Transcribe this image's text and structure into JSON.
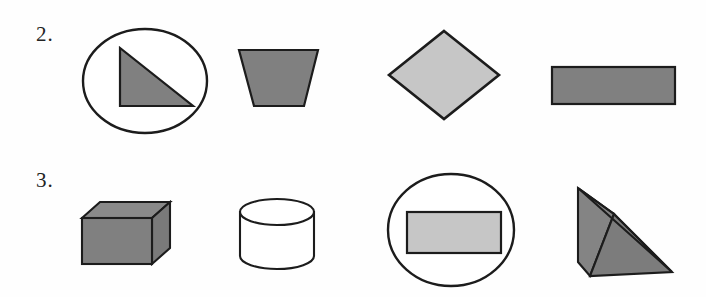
{
  "page": {
    "width": 706,
    "height": 297,
    "background": "#fefefe",
    "document_type": "geometry-shapes-worksheet"
  },
  "colors": {
    "outline": "#1c1c1c",
    "fill_dark_gray": "#808080",
    "fill_light_gray": "#c6c6c6",
    "fill_white": "#ffffff",
    "text": "#232323"
  },
  "rows": [
    {
      "label": "2.",
      "name": "row-2",
      "shapes": [
        {
          "name": "circle-with-right-triangle",
          "kind": "2d-composite",
          "description": "circle outline containing a shaded right triangle",
          "fill": "#808080",
          "outline": "#1c1c1c"
        },
        {
          "name": "trapezoid",
          "kind": "2d",
          "description": "shaded trapezoid, wider at top",
          "fill": "#808080",
          "outline": "#1c1c1c"
        },
        {
          "name": "diamond",
          "kind": "2d",
          "description": "light shaded rhombus / diamond",
          "fill": "#c6c6c6",
          "outline": "#1c1c1c"
        },
        {
          "name": "rectangle",
          "kind": "2d",
          "description": "shaded horizontal rectangle",
          "fill": "#808080",
          "outline": "#1c1c1c"
        }
      ]
    },
    {
      "label": "3.",
      "name": "row-3",
      "shapes": [
        {
          "name": "cube",
          "kind": "3d",
          "description": "shaded rectangular prism / cube in oblique projection",
          "fill": "#808080",
          "outline": "#1c1c1c"
        },
        {
          "name": "cylinder",
          "kind": "3d",
          "description": "unshaded white cylinder with elliptical top",
          "fill": "#ffffff",
          "outline": "#1c1c1c"
        },
        {
          "name": "circle-with-rectangle",
          "kind": "2d-composite",
          "description": "circle outline containing a light shaded rectangle",
          "fill": "#c6c6c6",
          "outline": "#1c1c1c"
        },
        {
          "name": "triangular-prism",
          "kind": "3d",
          "description": "shaded triangular prism / wedge",
          "fill": "#808080",
          "outline": "#1c1c1c"
        }
      ]
    }
  ]
}
